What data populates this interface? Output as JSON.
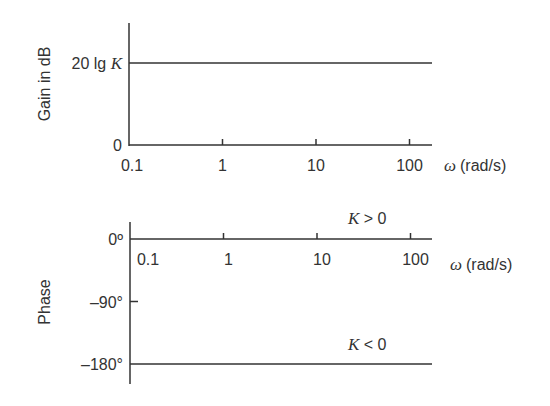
{
  "chart_data": [
    {
      "type": "line",
      "title": "",
      "ylabel": "Gain in dB",
      "xlabel": "(rad/s)",
      "xlabel_symbol": "ω",
      "xscale": "log",
      "xlim": [
        0.1,
        150
      ],
      "x_ticks": [
        0.1,
        1,
        10,
        100
      ],
      "x_tick_labels": [
        "0.1",
        "1",
        "10",
        "100"
      ],
      "y_ticks": [
        "0",
        "20 lg K"
      ],
      "y_tick_label_prefix": "20 lg ",
      "y_tick_label_var": "K",
      "series": [
        {
          "name": "Gain",
          "level": "20 lg K",
          "x": [
            0.1,
            150
          ]
        }
      ],
      "grid": false
    },
    {
      "type": "line",
      "title": "",
      "ylabel": "Phase",
      "xlabel": "(rad/s)",
      "xlabel_symbol": "ω",
      "xscale": "log",
      "xlim": [
        0.1,
        150
      ],
      "ylim": [
        -200,
        20
      ],
      "x_ticks": [
        0.1,
        1,
        10,
        100
      ],
      "x_tick_labels": [
        "0.1",
        "1",
        "10",
        "100"
      ],
      "y_ticks": [
        0,
        -90,
        -180
      ],
      "y_tick_labels": [
        "0º",
        "–90°",
        "–180°"
      ],
      "series": [
        {
          "name": "K > 0",
          "label_var": "K",
          "label_rest": " > 0",
          "y": 0,
          "x": [
            0.1,
            150
          ]
        },
        {
          "name": "K < 0",
          "label_var": "K",
          "label_rest": " < 0",
          "y": -180,
          "x": [
            0.1,
            150
          ]
        }
      ],
      "grid": false
    }
  ]
}
